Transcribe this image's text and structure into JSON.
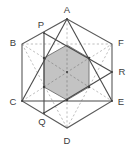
{
  "figure": {
    "type": "geometry-diagram",
    "canvas": {
      "width": 132,
      "height": 152
    },
    "colors": {
      "outline": "#5a5a5a",
      "solid_line": "#4a4a4a",
      "dashed_line": "#a8a8a8",
      "shade_fill": "#b9b9b9",
      "shade_stroke": "#6b6b6b",
      "label_text": "#3b3b3b",
      "background": "#ffffff"
    },
    "labels": {
      "A": "A",
      "B": "B",
      "C": "C",
      "D": "D",
      "E": "E",
      "F": "F",
      "P": "P",
      "Q": "Q",
      "R": "R"
    },
    "points": {
      "A": {
        "x": 67,
        "y": 19
      },
      "B": {
        "x": 22,
        "y": 44
      },
      "C": {
        "x": 22,
        "y": 101
      },
      "D": {
        "x": 67,
        "y": 128
      },
      "E": {
        "x": 112,
        "y": 101
      },
      "F": {
        "x": 112,
        "y": 44
      },
      "P": {
        "x": 44,
        "y": 33
      },
      "Q": {
        "x": 44,
        "y": 113
      },
      "R": {
        "x": 112,
        "y": 72
      },
      "O": {
        "x": 67,
        "y": 72
      },
      "M1": {
        "x": 44,
        "y": 58
      },
      "M2": {
        "x": 89,
        "y": 58
      },
      "M3": {
        "x": 89,
        "y": 87
      },
      "M4": {
        "x": 44,
        "y": 87
      }
    },
    "label_positions": {
      "A": {
        "x": 67,
        "y": 10
      },
      "B": {
        "x": 13,
        "y": 43
      },
      "C": {
        "x": 13,
        "y": 102
      },
      "D": {
        "x": 67,
        "y": 142
      },
      "E": {
        "x": 121,
        "y": 102
      },
      "F": {
        "x": 121,
        "y": 43
      },
      "P": {
        "x": 41,
        "y": 25
      },
      "Q": {
        "x": 42,
        "y": 122
      },
      "R": {
        "x": 122,
        "y": 72
      }
    },
    "shaded_polygon": [
      "P_int_top_left",
      "A_int",
      "M2",
      "M3",
      "D_int",
      "M4"
    ],
    "shaded_polygon_points": [
      {
        "x": 44,
        "y": 58
      },
      {
        "x": 67,
        "y": 45
      },
      {
        "x": 89,
        "y": 58
      },
      {
        "x": 89,
        "y": 87
      },
      {
        "x": 67,
        "y": 100
      },
      {
        "x": 44,
        "y": 87
      }
    ],
    "outer_hexagon": [
      "A",
      "F",
      "E",
      "D",
      "C",
      "B"
    ],
    "solid_segments": [
      {
        "name": "hex-A-F",
        "from": "A",
        "to": "F"
      },
      {
        "name": "hex-F-E",
        "from": "F",
        "to": "E"
      },
      {
        "name": "hex-E-D",
        "from": "E",
        "to": "D"
      },
      {
        "name": "hex-D-C",
        "from": "D",
        "to": "C"
      },
      {
        "name": "hex-C-B",
        "from": "C",
        "to": "B"
      },
      {
        "name": "hex-B-A",
        "from": "B",
        "to": "A"
      },
      {
        "name": "chord-A-C",
        "from": "A",
        "to": "C"
      },
      {
        "name": "chord-A-E",
        "from": "A",
        "to": "E"
      },
      {
        "name": "chord-C-E",
        "from": "C",
        "to": "E"
      },
      {
        "name": "chord-P-R",
        "from": "P",
        "to": "R"
      },
      {
        "name": "chord-Q-R",
        "from": "Q",
        "to": "R"
      },
      {
        "name": "chord-P-Q",
        "from": "P",
        "to": "Q"
      }
    ],
    "dashed_segments": [
      {
        "name": "diag-A-D",
        "from": "A",
        "to": "D"
      },
      {
        "name": "diag-B-E",
        "from": "B",
        "to": "E"
      },
      {
        "name": "diag-C-F",
        "from": "C",
        "to": "F"
      },
      {
        "name": "chord-B-D",
        "from": "B",
        "to": "D"
      },
      {
        "name": "chord-B-F",
        "from": "B",
        "to": "F"
      },
      {
        "name": "chord-D-F",
        "from": "D",
        "to": "F"
      }
    ]
  }
}
